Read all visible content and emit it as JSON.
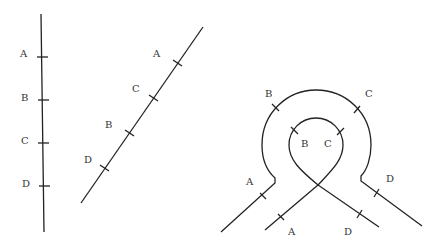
{
  "figure": {
    "panels": [
      {
        "name": "vertical-line",
        "order_along_line": [
          "A",
          "B",
          "C",
          "D"
        ],
        "labels": [
          "A",
          "B",
          "C",
          "D"
        ]
      },
      {
        "name": "diagonal-line",
        "order_along_line": [
          "A",
          "C",
          "B",
          "D"
        ],
        "labels": [
          "A",
          "C",
          "B",
          "D"
        ]
      },
      {
        "name": "loop-figure",
        "outer_labels": [
          "A",
          "B",
          "C",
          "D"
        ],
        "inner_labels": [
          "B",
          "C",
          "A",
          "D"
        ]
      }
    ]
  },
  "colors": {
    "stroke": "#222222",
    "text": "#333333",
    "background": "#ffffff"
  }
}
